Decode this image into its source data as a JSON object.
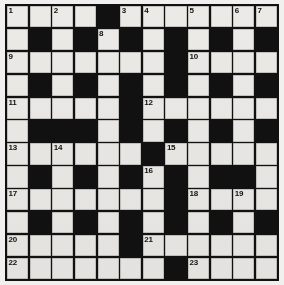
{
  "puzzle": {
    "type": "crossword-grid",
    "title": "Crossword Puzzle Grid",
    "columns": 12,
    "rows": 12,
    "colors": {
      "block": "#111111",
      "cell": "#eceae6",
      "page": "#f2f0ee",
      "number": "#111111"
    },
    "legend": {
      "white_cell": "fillable letter square",
      "black_cell": "blocked square"
    },
    "grid": [
      [
        "w",
        "w",
        "w",
        "w",
        "b",
        "w",
        "w",
        "w",
        "w",
        "w",
        "w",
        "w"
      ],
      [
        "w",
        "b",
        "w",
        "b",
        "w",
        "b",
        "w",
        "b",
        "w",
        "b",
        "w",
        "b"
      ],
      [
        "w",
        "w",
        "w",
        "w",
        "w",
        "w",
        "w",
        "b",
        "w",
        "w",
        "w",
        "w"
      ],
      [
        "w",
        "b",
        "w",
        "b",
        "w",
        "b",
        "w",
        "b",
        "w",
        "b",
        "w",
        "b"
      ],
      [
        "w",
        "w",
        "w",
        "w",
        "w",
        "b",
        "w",
        "w",
        "w",
        "w",
        "w",
        "w"
      ],
      [
        "w",
        "b",
        "b",
        "b",
        "w",
        "b",
        "w",
        "b",
        "w",
        "b",
        "w",
        "b"
      ],
      [
        "w",
        "w",
        "w",
        "w",
        "w",
        "w",
        "b",
        "w",
        "w",
        "w",
        "w",
        "w"
      ],
      [
        "w",
        "b",
        "w",
        "b",
        "w",
        "b",
        "w",
        "b",
        "w",
        "b",
        "b",
        "w"
      ],
      [
        "w",
        "w",
        "w",
        "w",
        "w",
        "w",
        "w",
        "b",
        "w",
        "w",
        "w",
        "w"
      ],
      [
        "w",
        "b",
        "w",
        "b",
        "w",
        "b",
        "w",
        "b",
        "w",
        "b",
        "w",
        "b"
      ],
      [
        "w",
        "w",
        "w",
        "w",
        "w",
        "b",
        "w",
        "w",
        "w",
        "w",
        "w",
        "w"
      ],
      [
        "w",
        "w",
        "w",
        "w",
        "w",
        "w",
        "w",
        "b",
        "w",
        "w",
        "w",
        "w"
      ]
    ],
    "numbers": [
      {
        "n": "1",
        "row": 1,
        "col": 1
      },
      {
        "n": "2",
        "row": 1,
        "col": 3
      },
      {
        "n": "3",
        "row": 1,
        "col": 6
      },
      {
        "n": "4",
        "row": 1,
        "col": 7
      },
      {
        "n": "5",
        "row": 1,
        "col": 9
      },
      {
        "n": "6",
        "row": 1,
        "col": 11
      },
      {
        "n": "7",
        "row": 1,
        "col": 12
      },
      {
        "n": "8",
        "row": 2,
        "col": 5
      },
      {
        "n": "9",
        "row": 3,
        "col": 1
      },
      {
        "n": "10",
        "row": 3,
        "col": 9
      },
      {
        "n": "11",
        "row": 5,
        "col": 1
      },
      {
        "n": "12",
        "row": 5,
        "col": 7
      },
      {
        "n": "13",
        "row": 7,
        "col": 1
      },
      {
        "n": "14",
        "row": 7,
        "col": 3
      },
      {
        "n": "15",
        "row": 7,
        "col": 8
      },
      {
        "n": "16",
        "row": 8,
        "col": 7
      },
      {
        "n": "17",
        "row": 9,
        "col": 1
      },
      {
        "n": "18",
        "row": 9,
        "col": 9
      },
      {
        "n": "19",
        "row": 9,
        "col": 11
      },
      {
        "n": "20",
        "row": 11,
        "col": 1
      },
      {
        "n": "21",
        "row": 11,
        "col": 7
      },
      {
        "n": "22",
        "row": 12,
        "col": 1
      },
      {
        "n": "23",
        "row": 12,
        "col": 9
      }
    ]
  }
}
